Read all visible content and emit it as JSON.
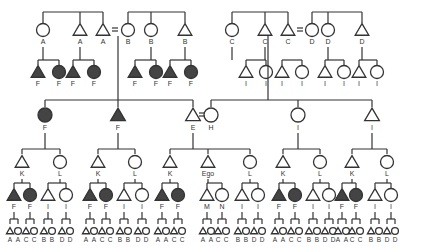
{
  "diagram": {
    "type": "kinship-chart",
    "legend": {
      "triangle": "male",
      "circle": "female",
      "filled": "shaded group F",
      "equals": "marriage"
    },
    "generation1": {
      "left_family": [
        {
          "sex": "female",
          "label": "A"
        },
        {
          "sex": "male",
          "label": "A"
        },
        {
          "sex": "male",
          "label": "A"
        },
        {
          "sex": "female",
          "label": "B"
        },
        {
          "sex": "female",
          "label": "B"
        },
        {
          "sex": "male",
          "label": "B"
        }
      ],
      "right_family": [
        {
          "sex": "female",
          "label": "C"
        },
        {
          "sex": "male",
          "label": "C"
        },
        {
          "sex": "male",
          "label": "C"
        },
        {
          "sex": "female",
          "label": "D"
        },
        {
          "sex": "female",
          "label": "D"
        },
        {
          "sex": "male",
          "label": "D"
        }
      ]
    },
    "generation2_side": {
      "left": [
        {
          "sex": "male",
          "label": "F",
          "filled": true
        },
        {
          "sex": "female",
          "label": "F",
          "filled": true
        },
        {
          "sex": "male",
          "label": "F",
          "filled": true
        },
        {
          "sex": "female",
          "label": "F",
          "filled": true
        },
        {
          "sex": "male",
          "label": "F",
          "filled": true
        },
        {
          "sex": "female",
          "label": "F",
          "filled": true
        },
        {
          "sex": "male",
          "label": "F",
          "filled": true
        },
        {
          "sex": "female",
          "label": "F",
          "filled": true
        }
      ],
      "right": [
        {
          "sex": "male",
          "label": "I"
        },
        {
          "sex": "female",
          "label": "I"
        },
        {
          "sex": "male",
          "label": "I"
        },
        {
          "sex": "female",
          "label": "I"
        },
        {
          "sex": "male",
          "label": "I"
        },
        {
          "sex": "female",
          "label": "I"
        },
        {
          "sex": "male",
          "label": "I"
        },
        {
          "sex": "female",
          "label": "I"
        }
      ]
    },
    "generation2_main": [
      {
        "sex": "female",
        "label": "F",
        "filled": true
      },
      {
        "sex": "male",
        "label": "F",
        "filled": true
      },
      {
        "sex": "male",
        "label": "E"
      },
      {
        "sex": "female",
        "label": "H"
      },
      {
        "sex": "female",
        "label": "I"
      },
      {
        "sex": "male",
        "label": "I"
      }
    ],
    "generation3": [
      {
        "sex": "male",
        "label": "K"
      },
      {
        "sex": "female",
        "label": "L"
      },
      {
        "sex": "male",
        "label": "K"
      },
      {
        "sex": "female",
        "label": "L"
      },
      {
        "sex": "male",
        "label": "K"
      },
      {
        "sex": "male",
        "label": "Ego"
      },
      {
        "sex": "female",
        "label": "L"
      },
      {
        "sex": "male",
        "label": "K"
      },
      {
        "sex": "female",
        "label": "L"
      },
      {
        "sex": "male",
        "label": "K"
      },
      {
        "sex": "female",
        "label": "L"
      }
    ],
    "generation4": [
      "F",
      "F",
      "I",
      "I",
      "F",
      "F",
      "I",
      "I",
      "F",
      "F",
      "M",
      "N",
      "I",
      "I",
      "F",
      "F",
      "I",
      "I",
      "F",
      "F",
      "I",
      "I"
    ],
    "generation4_filled": [
      true,
      true,
      false,
      false,
      true,
      true,
      false,
      false,
      true,
      true,
      false,
      false,
      false,
      false,
      true,
      true,
      false,
      false,
      true,
      true,
      false,
      false
    ],
    "generation5": [
      "A",
      "A",
      "C",
      "C",
      "B",
      "B",
      "D",
      "D",
      "A",
      "A",
      "C",
      "C",
      "B",
      "B",
      "D",
      "D",
      "A",
      "A",
      "C",
      "C",
      "A",
      "A",
      "C",
      "C",
      "B",
      "B",
      "D",
      "D",
      "A",
      "A",
      "C",
      "C",
      "B",
      "B",
      "D",
      "D",
      "A",
      "A",
      "C",
      "C",
      "B",
      "B",
      "D",
      "D"
    ]
  }
}
